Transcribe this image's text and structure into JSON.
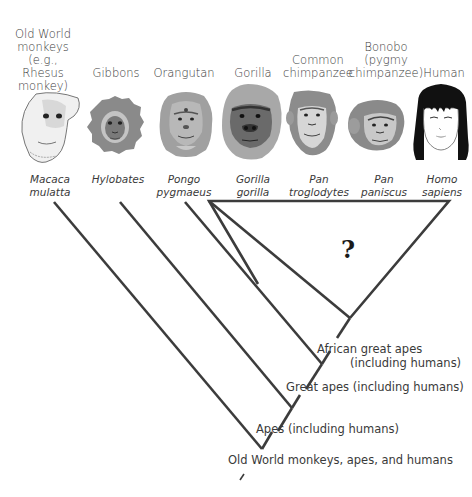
{
  "taxa": [
    {
      "common": "Old World monkeys (e.g., Rhesus monkey)",
      "common_lines": [
        "Old World",
        "monkeys",
        "(e.g., Rhesus",
        "monkey)"
      ],
      "sci_lines": [
        "Macaca",
        "mulatta"
      ],
      "icon": "rhesus-monkey-face"
    },
    {
      "common": "Gibbons",
      "common_lines": [
        "Gibbons"
      ],
      "sci_lines": [
        "Hylobates"
      ],
      "icon": "gibbon-face"
    },
    {
      "common": "Orangutan",
      "common_lines": [
        "Orangutan"
      ],
      "sci_lines": [
        "Pongo",
        "pygmaeus"
      ],
      "icon": "orangutan-face"
    },
    {
      "common": "Gorilla",
      "common_lines": [
        "Gorilla"
      ],
      "sci_lines": [
        "Gorilla",
        "gorilla"
      ],
      "icon": "gorilla-face"
    },
    {
      "common": "Common chimpanzee",
      "common_lines": [
        "Common",
        "chimpanzee"
      ],
      "sci_lines": [
        "Pan",
        "troglodytes"
      ],
      "icon": "chimpanzee-face"
    },
    {
      "common": "Bonobo (pygmy chimpanzee)",
      "common_lines": [
        "Bonobo",
        "(pygmy",
        "chimpanzee)"
      ],
      "sci_lines": [
        "Pan",
        "paniscus"
      ],
      "icon": "bonobo-face"
    },
    {
      "common": "Human",
      "common_lines": [
        "Human"
      ],
      "sci_lines": [
        "Homo",
        "sapiens"
      ],
      "icon": "human-face"
    }
  ],
  "tree": {
    "unresolved_marker": "?",
    "nodes": [
      {
        "id": "african-great-apes",
        "lines": [
          "African great apes",
          "(including humans)"
        ]
      },
      {
        "id": "great-apes",
        "lines": [
          "Great apes (including humans)"
        ]
      },
      {
        "id": "apes",
        "lines": [
          "Apes (including humans)"
        ]
      },
      {
        "id": "old-world",
        "lines": [
          "Old World monkeys, apes, and humans"
        ]
      }
    ]
  },
  "colors": {
    "line": "#3c3c3c",
    "text": "#3a3a3a",
    "fur_gray": "#8a8a8a",
    "skin_light": "#e6e6e6",
    "hair_black": "#111111"
  }
}
